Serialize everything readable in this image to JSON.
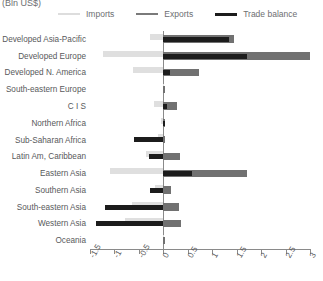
{
  "units_caption": "(Bln US$)",
  "legend": {
    "items": [
      {
        "label": "Imports",
        "key": "imports",
        "color": "#dfdfdf"
      },
      {
        "label": "Exports",
        "key": "exports",
        "color": "#717171"
      },
      {
        "label": "Trade balance",
        "key": "balance",
        "color": "#1c1c1c"
      }
    ]
  },
  "chart_data": {
    "type": "bar",
    "orientation": "horizontal",
    "title": "",
    "subtitle": "",
    "xlabel": "(Bln US$)",
    "ylabel": "",
    "xlim": [
      -1.5,
      3
    ],
    "xticks": [
      -1.5,
      -1,
      -0.5,
      0,
      0.5,
      1,
      1.5,
      2,
      2.5,
      3
    ],
    "xticklabels": [
      "-1.5",
      "-1",
      "-0.5",
      "0",
      "0.5",
      "1",
      "1.5",
      "2",
      "2.5",
      "3"
    ],
    "grid": false,
    "legend_position": "top",
    "categories": [
      "Developed Asia-Pacific",
      "Developed Europe",
      "Developed N. America",
      "South-eastern Europe",
      "C I S",
      "Northern Africa",
      "Sub-Saharan Africa",
      "Latin Am, Caribbean",
      "Eastern Asia",
      "Southern Asia",
      "South-eastern Asia",
      "Western Asia",
      "Oceania"
    ],
    "series": [
      {
        "name": "Imports",
        "color": "#dfdfdf",
        "values": [
          -0.27,
          -1.23,
          -0.62,
          -0.01,
          -0.2,
          -0.04,
          -0.1,
          -0.36,
          -1.09,
          -0.18,
          -0.64,
          -0.78,
          -0.01
        ]
      },
      {
        "name": "Exports",
        "color": "#717171",
        "values": [
          1.44,
          3.0,
          0.72,
          0.01,
          0.27,
          0.04,
          0.03,
          0.35,
          1.72,
          0.16,
          0.32,
          0.37,
          0.01
        ]
      },
      {
        "name": "Trade balance",
        "color": "#1c1c1c",
        "values": [
          1.34,
          1.72,
          0.14,
          0.0,
          0.07,
          0.01,
          -0.6,
          -0.29,
          0.58,
          -0.27,
          -1.2,
          -1.38,
          0.0
        ]
      }
    ]
  }
}
